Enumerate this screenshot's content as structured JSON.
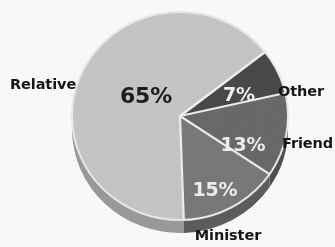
{
  "chart_data": {
    "type": "pie",
    "title": "",
    "subtitle": "",
    "xlabel": "",
    "ylabel": "",
    "legend_position": "none",
    "grid": false,
    "three_d": true,
    "categories": [
      "Relative",
      "Minister",
      "Friend",
      "Other"
    ],
    "values": [
      65,
      15,
      13,
      7
    ],
    "value_labels": [
      "65%",
      "15%",
      "13%",
      "7%"
    ],
    "slices": [
      {
        "name": "Relative",
        "value": 65,
        "value_label": "65%",
        "label": "Relative",
        "color": "#c9c9c9",
        "side_color": "#9d9d9d",
        "label_color": "#1d1d1d"
      },
      {
        "name": "Minister",
        "value": 15,
        "value_label": "15%",
        "label": "Minister",
        "color": "#7b7b7b",
        "side_color": "#5e5e5e",
        "label_color": "#f3f3f3"
      },
      {
        "name": "Friend",
        "value": 13,
        "value_label": "13%",
        "label": "Friend",
        "color": "#6b6b6b",
        "side_color": "#515151",
        "label_color": "#f3f3f3"
      },
      {
        "name": "Other",
        "value": 7,
        "value_label": "7%",
        "label": "Other",
        "color": "#4a4a4a",
        "side_color": "#3a3a3a",
        "label_color": "#f3f3f3"
      }
    ],
    "separator_color": "#f2f2f2",
    "background": "#ffffff"
  },
  "labels": {
    "relative": "Relative",
    "minister": "Minister",
    "friend": "Friend",
    "other": "Other"
  },
  "values": {
    "relative": "65%",
    "minister": "15%",
    "friend": "13%",
    "other": "7%"
  }
}
